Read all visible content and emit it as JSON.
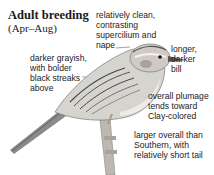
{
  "heading": {
    "title": "Adult breeding",
    "subtitle": "(Apr–Aug)"
  },
  "annotations": [
    {
      "id": "supercilium",
      "lines": [
        "relatively clean,",
        "contrasting",
        "supercilium and",
        "nape"
      ]
    },
    {
      "id": "bill",
      "lines": [
        "longer,",
        "darker",
        "bill"
      ]
    },
    {
      "id": "back",
      "lines": [
        "darker grayish,",
        "with bolder",
        "black streaks",
        "above"
      ]
    },
    {
      "id": "plumage",
      "lines": [
        "overall plumage",
        "tends toward",
        "Clay-colored"
      ]
    },
    {
      "id": "size",
      "lines": [
        "larger overall than",
        "Southern, with",
        "relatively short tail"
      ]
    }
  ]
}
